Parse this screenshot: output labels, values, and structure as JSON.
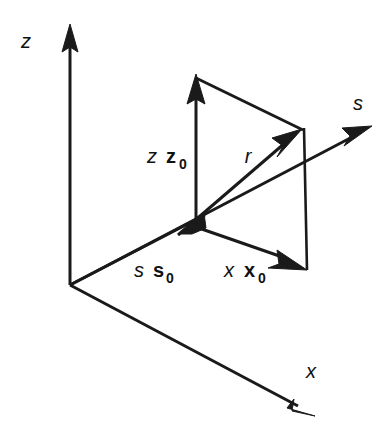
{
  "figure": {
    "kind": "vector-geometry-diagram",
    "background_color": "#ffffff",
    "ink_color": "#1a1a1a"
  },
  "axes": [
    {
      "id": "z-axis",
      "label": "z",
      "label_style": "italic",
      "direction": "up",
      "origin": [
        70,
        285
      ],
      "tip": [
        70,
        26
      ]
    },
    {
      "id": "x-axis",
      "label": "x",
      "label_style": "italic",
      "direction": "down-right",
      "origin": [
        70,
        285
      ],
      "tip": [
        312,
        414
      ]
    }
  ],
  "vectors": [
    {
      "id": "s-s0-vector",
      "label_italic": "s",
      "label_bold": "s",
      "label_subscript": "0",
      "from": [
        70,
        285
      ],
      "to": [
        190,
        223
      ],
      "description": "incident unit direction vector s s0 pointing down-left arrowhead at parallelogram base corner"
    },
    {
      "id": "z-z0-vector",
      "label_italic": "z",
      "label_bold": "z",
      "label_subscript": "0",
      "from": [
        196,
        224
      ],
      "to": [
        196,
        76
      ],
      "description": "vertical component vector z z0 pointing up"
    },
    {
      "id": "x-x0-vector",
      "label_italic": "x",
      "label_bold": "x",
      "label_subscript": "0",
      "from": [
        192,
        226
      ],
      "to": [
        305,
        268
      ],
      "description": "horizontal component vector x x0 pointing down-right"
    },
    {
      "id": "r-vector",
      "label_italic": "r",
      "from": [
        178,
        232
      ],
      "to": [
        300,
        131
      ],
      "description": "resultant position vector r pointing up-right to parallelogram far corner"
    },
    {
      "id": "s-ray",
      "label_italic": "s",
      "from": [
        70,
        285
      ],
      "to": [
        370,
        128
      ],
      "description": "outgoing scattered ray direction s extending beyond the parallelogram"
    }
  ],
  "construction_lines": [
    {
      "id": "parallelogram-top-edge",
      "from": [
        196,
        76
      ],
      "to": [
        302,
        128
      ]
    },
    {
      "id": "parallelogram-right-edge",
      "from": [
        303,
        128
      ],
      "to": [
        306,
        270
      ]
    }
  ],
  "labels": {
    "z_axis": "z",
    "x_axis": "x",
    "s_ray": "s",
    "r_vector": "r",
    "z_component_italic": "z",
    "z_component_bold": "z",
    "z_component_sub": "0",
    "x_component_italic": "x",
    "x_component_bold": "x",
    "x_component_sub": "0",
    "s_component_italic": "s",
    "s_component_bold": "s",
    "s_component_sub": "0"
  }
}
